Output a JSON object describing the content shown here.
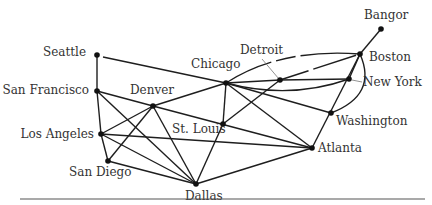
{
  "diagram": {
    "title": "",
    "colors": {
      "edge": "#1e1e1e",
      "node": "#111111",
      "label": "#333333",
      "rule": "#555555"
    },
    "nodes": [
      {
        "id": "seattle",
        "label": "Seattle",
        "x": 97,
        "y": 55
      },
      {
        "id": "sanfrancisco",
        "label": "San Francisco",
        "x": 97,
        "y": 91
      },
      {
        "id": "losangeles",
        "label": "Los Angeles",
        "x": 101,
        "y": 134
      },
      {
        "id": "sandiego",
        "label": "San Diego",
        "x": 108,
        "y": 161
      },
      {
        "id": "denver",
        "label": "Denver",
        "x": 153,
        "y": 106
      },
      {
        "id": "dallas",
        "label": "Dallas",
        "x": 196,
        "y": 184
      },
      {
        "id": "stlouis",
        "label": "St. Louis",
        "x": 223,
        "y": 124
      },
      {
        "id": "chicago",
        "label": "Chicago",
        "x": 226,
        "y": 83
      },
      {
        "id": "detroit",
        "label": "Detroit",
        "x": 280,
        "y": 80
      },
      {
        "id": "atlanta",
        "label": "Atlanta",
        "x": 312,
        "y": 148
      },
      {
        "id": "washington",
        "label": "Washington",
        "x": 331,
        "y": 113
      },
      {
        "id": "newyork",
        "label": "New York",
        "x": 349,
        "y": 79
      },
      {
        "id": "boston",
        "label": "Boston",
        "x": 360,
        "y": 54
      },
      {
        "id": "bangor",
        "label": "Bangor",
        "x": 381,
        "y": 29
      }
    ],
    "edges": [
      [
        "seattle",
        "sanfrancisco"
      ],
      [
        "seattle",
        "chicago"
      ],
      [
        "sanfrancisco",
        "losangeles"
      ],
      [
        "sanfrancisco",
        "denver"
      ],
      [
        "sanfrancisco",
        "dallas"
      ],
      [
        "losangeles",
        "sandiego"
      ],
      [
        "losangeles",
        "denver"
      ],
      [
        "losangeles",
        "dallas"
      ],
      [
        "losangeles",
        "atlanta"
      ],
      [
        "sandiego",
        "denver"
      ],
      [
        "sandiego",
        "dallas"
      ],
      [
        "denver",
        "chicago"
      ],
      [
        "denver",
        "dallas"
      ],
      [
        "denver",
        "atlanta"
      ],
      [
        "dallas",
        "stlouis"
      ],
      [
        "dallas",
        "atlanta"
      ],
      [
        "stlouis",
        "chicago"
      ],
      [
        "stlouis",
        "atlanta"
      ],
      [
        "stlouis",
        "detroit"
      ],
      [
        "chicago",
        "detroit"
      ],
      [
        "chicago",
        "newyork"
      ],
      [
        "chicago",
        "boston"
      ],
      [
        "chicago",
        "washington"
      ],
      [
        "chicago",
        "atlanta"
      ],
      [
        "detroit",
        "newyork"
      ],
      [
        "detroit",
        "boston"
      ],
      [
        "newyork",
        "boston"
      ],
      [
        "boston",
        "bangor"
      ],
      [
        "boston",
        "washington"
      ],
      [
        "boston",
        "atlanta"
      ],
      [
        "washington",
        "atlanta"
      ]
    ]
  }
}
